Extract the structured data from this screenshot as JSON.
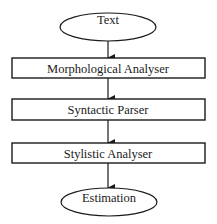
{
  "diagram": {
    "type": "flowchart",
    "colors": {
      "stroke": "#1a1a1a",
      "fill": "#ffffff",
      "text": "#1a1a1a"
    },
    "nodes": [
      {
        "id": "text",
        "shape": "ellipse",
        "label": "Text"
      },
      {
        "id": "morph",
        "shape": "rectangle",
        "label": "Morphological Analyser"
      },
      {
        "id": "syntax",
        "shape": "rectangle",
        "label": "Syntactic Parser"
      },
      {
        "id": "style",
        "shape": "rectangle",
        "label": "Stylistic Analyser"
      },
      {
        "id": "estimate",
        "shape": "ellipse",
        "label": "Estimation"
      }
    ],
    "edges": [
      {
        "from": "text",
        "to": "morph"
      },
      {
        "from": "morph",
        "to": "syntax"
      },
      {
        "from": "syntax",
        "to": "style"
      },
      {
        "from": "style",
        "to": "estimate"
      }
    ]
  }
}
